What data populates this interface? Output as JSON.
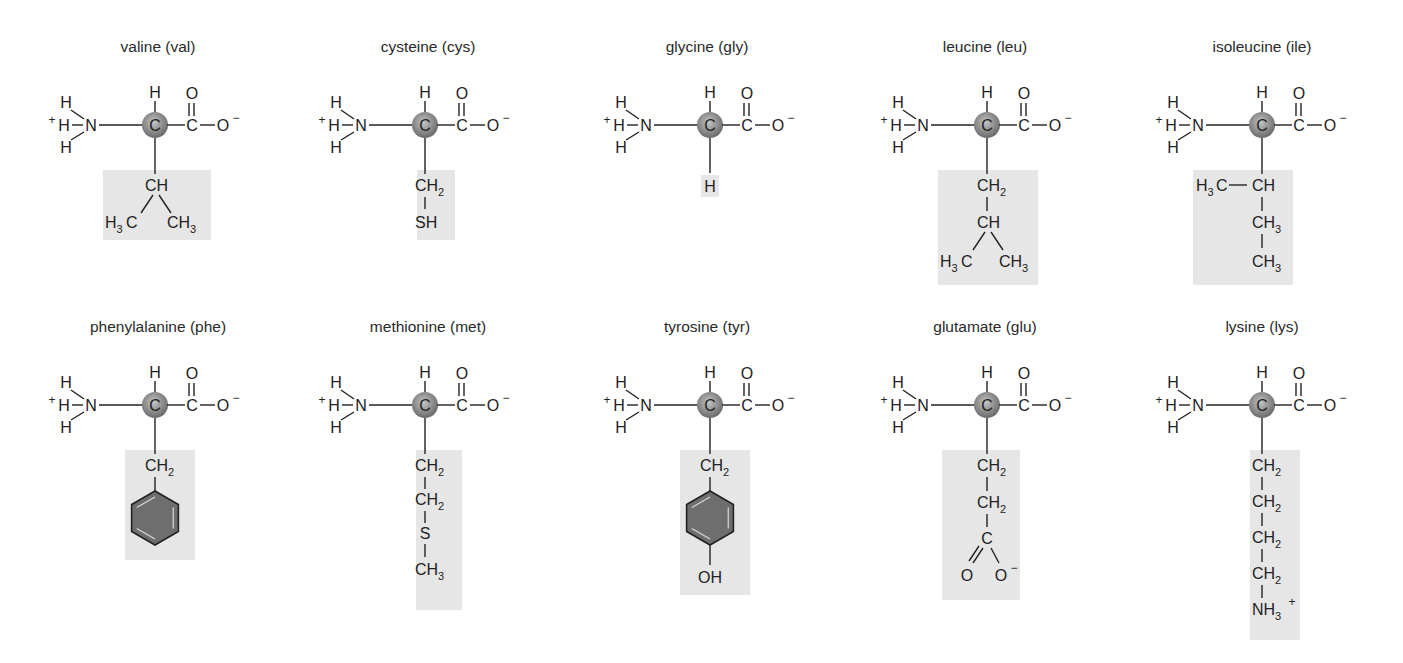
{
  "figure": {
    "colors": {
      "background": "#ffffff",
      "side_chain_highlight": "#e6e6e6",
      "alpha_carbon": "#8a8a8a",
      "aromatic_ring": "#6e6e6e",
      "text": "#222222"
    },
    "backbone": {
      "ammonium": "+H—N(H)(H)",
      "alpha_carbon": "C",
      "alpha_h": "H",
      "carboxylate": "C(=O)—O⁻"
    },
    "amino_acids": [
      {
        "name": "valine (val)",
        "row": 1,
        "col": 1,
        "side_chain": [
          "CH",
          "H3C  CH3"
        ]
      },
      {
        "name": "cysteine (cys)",
        "row": 1,
        "col": 2,
        "side_chain": [
          "CH2",
          "SH"
        ]
      },
      {
        "name": "glycine (gly)",
        "row": 1,
        "col": 3,
        "side_chain": [
          "H"
        ]
      },
      {
        "name": "leucine (leu)",
        "row": 1,
        "col": 4,
        "side_chain": [
          "CH2",
          "CH",
          "H3C  CH3"
        ]
      },
      {
        "name": "isoleucine (ile)",
        "row": 1,
        "col": 5,
        "side_chain": [
          "H3C—CH",
          "CH3",
          "CH3"
        ]
      },
      {
        "name": "phenylalanine (phe)",
        "row": 2,
        "col": 1,
        "side_chain": [
          "CH2",
          "benzene ring"
        ]
      },
      {
        "name": "methionine (met)",
        "row": 2,
        "col": 2,
        "side_chain": [
          "CH2",
          "CH2",
          "S",
          "CH3"
        ]
      },
      {
        "name": "tyrosine (tyr)",
        "row": 2,
        "col": 3,
        "side_chain": [
          "CH2",
          "benzene ring",
          "OH"
        ]
      },
      {
        "name": "glutamate (glu)",
        "row": 2,
        "col": 4,
        "side_chain": [
          "CH2",
          "CH2",
          "C",
          "O  O⁻"
        ]
      },
      {
        "name": "lysine (lys)",
        "row": 2,
        "col": 5,
        "side_chain": [
          "CH2",
          "CH2",
          "CH2",
          "CH2",
          "NH3+"
        ]
      }
    ]
  },
  "labels": {
    "t0": "valine (val)",
    "t1": "cysteine (cys)",
    "t2": "glycine (gly)",
    "t3": "leucine (leu)",
    "t4": "isoleucine (ile)",
    "t5": "phenylalanine (phe)",
    "t6": "methionine (met)",
    "t7": "tyrosine (tyr)",
    "t8": "glutamate (glu)",
    "t9": "lysine (lys)"
  },
  "atoms": {
    "H": "H",
    "N": "N",
    "C": "C",
    "O": "O",
    "S": "S",
    "SH": "SH",
    "OH": "OH",
    "CH": "CH",
    "sub2": "2",
    "sub3": "3",
    "plus": "+",
    "minus": "−",
    "H3": "H",
    "NH": "NH"
  }
}
